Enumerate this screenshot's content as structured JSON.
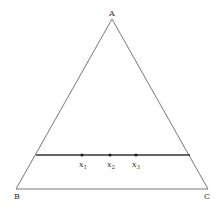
{
  "diagram": {
    "type": "triangle-with-segment",
    "vertices": [
      {
        "label": "A",
        "x": 112,
        "y": 19
      },
      {
        "label": "B",
        "x": 16,
        "y": 189
      },
      {
        "label": "C",
        "x": 208,
        "y": 189
      }
    ],
    "segment": {
      "y": 155,
      "x1": 36,
      "x2": 190
    },
    "points": [
      {
        "label": "x",
        "sub": "1",
        "x": 82,
        "y": 155
      },
      {
        "label": "x",
        "sub": "2",
        "x": 110,
        "y": 155
      },
      {
        "label": "x",
        "sub": "3",
        "x": 136,
        "y": 155
      }
    ],
    "colors": {
      "stroke": "#555555",
      "segment": "#333333",
      "point": "#222222"
    }
  }
}
